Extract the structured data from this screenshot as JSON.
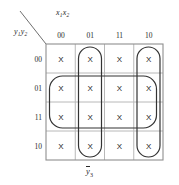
{
  "diagram": {
    "type": "karnaugh-map",
    "title_bottom": "y3-bar",
    "function_label": {
      "base": "y",
      "subscript": "3",
      "complemented": true,
      "text": "ȳ₃"
    },
    "axes": {
      "columns": {
        "variables_text": "x",
        "variables_sub": "1",
        "variables_text2": "x",
        "variables_sub2": "2",
        "label": "x₁x₂",
        "headers": [
          "00",
          "01",
          "11",
          "10"
        ]
      },
      "rows": {
        "variables_text": "y",
        "variables_sub": "1",
        "variables_text2": "y",
        "variables_sub2": "2",
        "label": "y₁y₂",
        "headers": [
          "00",
          "01",
          "11",
          "10"
        ]
      }
    },
    "cell_symbol": "X",
    "cells": [
      {
        "row": "00",
        "values": [
          "X",
          "X",
          "X",
          "X"
        ]
      },
      {
        "row": "01",
        "values": [
          "X",
          "X",
          "X",
          "X"
        ]
      },
      {
        "row": "11",
        "values": [
          "X",
          "X",
          "X",
          "X"
        ]
      },
      {
        "row": "10",
        "values": [
          "X",
          "X",
          "X",
          "X"
        ]
      }
    ],
    "groups": [
      {
        "name": "column-01-group",
        "orientation": "vertical",
        "columns": [
          "01"
        ],
        "rows": [
          "00",
          "01",
          "11",
          "10"
        ],
        "cell_count": 4
      },
      {
        "name": "column-10-group",
        "orientation": "vertical",
        "columns": [
          "10"
        ],
        "rows": [
          "00",
          "01",
          "11",
          "10"
        ],
        "cell_count": 4
      },
      {
        "name": "rows-01-11-group",
        "orientation": "horizontal",
        "columns": [
          "00",
          "01",
          "11",
          "10"
        ],
        "rows": [
          "01",
          "11"
        ],
        "cell_count": 8
      }
    ],
    "colors": {
      "grid_line": "#b4b4b4",
      "grid_border": "#8c8c8c",
      "group_outline": "#3a3a3a",
      "text": "#2a2a2a",
      "background": "#ffffff"
    }
  }
}
